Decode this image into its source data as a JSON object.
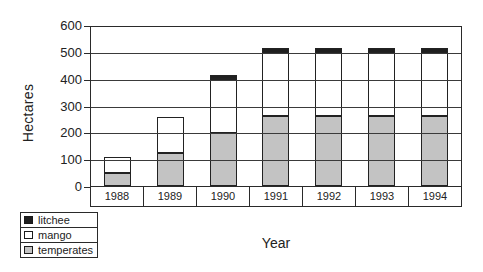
{
  "chart_data": {
    "type": "bar",
    "stacked": true,
    "title": "",
    "xlabel": "Year",
    "ylabel": "Hectares",
    "categories": [
      "1988",
      "1989",
      "1990",
      "1991",
      "1992",
      "1993",
      "1994"
    ],
    "series": [
      {
        "name": "litchee",
        "color": "#1f1f1f",
        "values": [
          0,
          0,
          15,
          20,
          20,
          20,
          20
        ]
      },
      {
        "name": "mango",
        "color": "#ffffff",
        "values": [
          60,
          135,
          205,
          235,
          235,
          235,
          235
        ]
      },
      {
        "name": "temperates",
        "color": "#c3c3c3",
        "values": [
          50,
          125,
          200,
          265,
          265,
          265,
          265
        ]
      }
    ],
    "totals": [
      110,
      260,
      420,
      520,
      520,
      520,
      520
    ],
    "ylim": [
      0,
      600
    ],
    "yticks": [
      "0",
      "100",
      "200",
      "300",
      "400",
      "500",
      "600"
    ],
    "grid": true,
    "axis_color": "#2a2a2a",
    "legend_position": "bottom-left",
    "legend_order": [
      "litchee",
      "mango",
      "temperates"
    ]
  }
}
